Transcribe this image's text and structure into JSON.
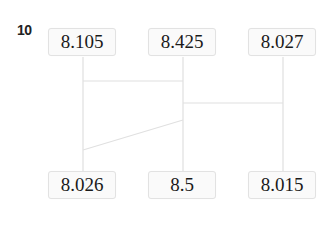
{
  "question": {
    "number": "10"
  },
  "diagram": {
    "top_row": [
      {
        "value": "8.105"
      },
      {
        "value": "8.425"
      },
      {
        "value": "8.027"
      }
    ],
    "bottom_row": [
      {
        "value": "8.026"
      },
      {
        "value": "8.5"
      },
      {
        "value": "8.015"
      }
    ],
    "line_color": "#e0e0e0",
    "box_border_color": "#e2e2e2"
  }
}
